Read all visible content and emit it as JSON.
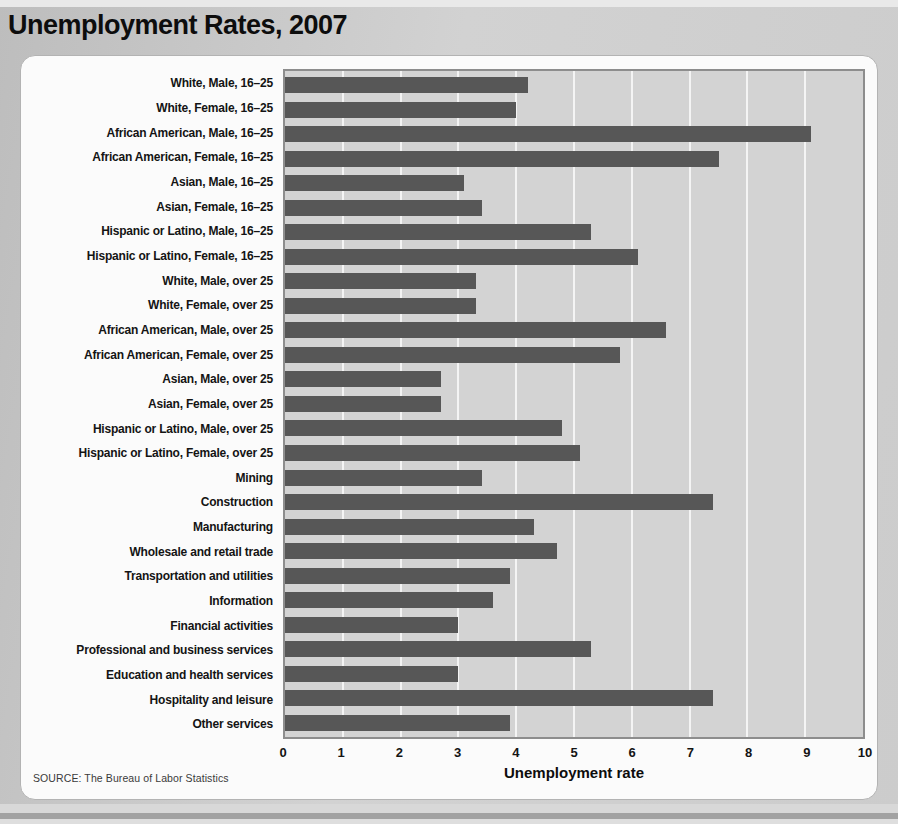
{
  "page": {
    "title": "Unemployment Rates, 2007",
    "source": "SOURCE: The Bureau of Labor Statistics"
  },
  "chart_data": {
    "type": "bar",
    "orientation": "horizontal",
    "title": "Unemployment Rates, 2007",
    "xlabel": "Unemployment rate",
    "ylabel": "",
    "xlim": [
      0,
      10
    ],
    "x_ticks": [
      0,
      1,
      2,
      3,
      4,
      5,
      6,
      7,
      8,
      9,
      10
    ],
    "grid": "vertical white gridlines at each integer tick",
    "legend": "none",
    "bar_color": "#575757",
    "plot_background": "#d3d3d3",
    "gridline_color": "#f4f4f4",
    "categories": [
      "White, Male, 16–25",
      "White, Female, 16–25",
      "African American, Male, 16–25",
      "African American, Female, 16–25",
      "Asian, Male, 16–25",
      "Asian, Female, 16–25",
      "Hispanic or Latino, Male, 16–25",
      "Hispanic or Latino, Female, 16–25",
      "White, Male, over 25",
      "White, Female, over 25",
      "African American, Male, over 25",
      "African American, Female, over 25",
      "Asian, Male, over 25",
      "Asian, Female, over 25",
      "Hispanic or Latino, Male, over 25",
      "Hispanic or Latino, Female, over 25",
      "Mining",
      "Construction",
      "Manufacturing",
      "Wholesale and retail trade",
      "Transportation and utilities",
      "Information",
      "Financial activities",
      "Professional and business services",
      "Education and health services",
      "Hospitality and leisure",
      "Other services"
    ],
    "values": [
      4.2,
      4.0,
      9.1,
      7.5,
      3.1,
      3.4,
      5.3,
      6.1,
      3.3,
      3.3,
      6.6,
      5.8,
      2.7,
      2.7,
      4.8,
      5.1,
      3.4,
      7.4,
      4.3,
      4.7,
      3.9,
      3.6,
      3.0,
      5.3,
      3.0,
      7.4,
      3.9
    ]
  }
}
